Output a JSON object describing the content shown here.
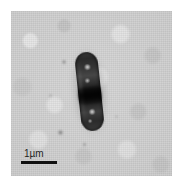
{
  "figure": {
    "kind": "micrograph",
    "modality": "phase-contrast light micrograph",
    "background_tone": "#cdcdcd",
    "cell_tone": "#1a1a1a"
  },
  "scalebar": {
    "label": "1µm",
    "value": 1,
    "unit": "µm",
    "bar_length_px": 36,
    "color": "#111111"
  },
  "cell": {
    "shape": "rod",
    "orientation": "near-vertical, tilted slightly left",
    "features": [
      "dark dense mid-cell band",
      "bright intracellular granules",
      "diffuse halo around cell outline"
    ]
  },
  "debris": [
    {
      "name": "speck-upper-left",
      "x": 51,
      "y": 49,
      "size": 4
    },
    {
      "name": "speck-lower-left",
      "x": 47,
      "y": 119,
      "size": 5
    },
    {
      "name": "speck-below-cell",
      "x": 72,
      "y": 132,
      "size": 3
    },
    {
      "name": "speck-mid-left",
      "x": 38,
      "y": 83,
      "size": 3
    }
  ]
}
